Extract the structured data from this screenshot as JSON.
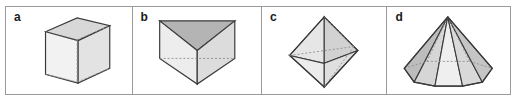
{
  "figure": {
    "caption_labels": [
      "a",
      "b",
      "c",
      "d"
    ],
    "panel_count": 4,
    "background_color": "#ffffff",
    "border_color": "#9a9a9a",
    "edge_color": "#3a3a3a",
    "hidden_edge_color": "#8d8d8d",
    "label_color": "#1a1a1a"
  },
  "panels": [
    {
      "label": "a",
      "shape_name": "cube",
      "shape_description": "cube drawn in parallel projection with hidden edges dashed",
      "faces": 6,
      "vertices": 8,
      "edges": 12,
      "fill_front": "#f2f2f2",
      "fill_top": "#d8d8d8",
      "fill_side": "#e3e3e3"
    },
    {
      "label": "b",
      "shape_name": "triangular-prism",
      "shape_description": "triangular prism standing on an edge, viewed from above with hidden edges dashed",
      "faces": 5,
      "vertices": 6,
      "edges": 9,
      "fill_front": "#ededed",
      "fill_top": "#b4b4b4",
      "fill_side": "#dcdcdc"
    },
    {
      "label": "c",
      "shape_name": "octahedron",
      "shape_description": "regular octahedron with upper and lower apex, hidden edges dashed",
      "faces": 8,
      "vertices": 6,
      "edges": 12,
      "fill_front": "#ececec",
      "fill_top": "#d2d2d2",
      "fill_side": "#dfdfdf"
    },
    {
      "label": "d",
      "shape_name": "hexagonal-pyramid",
      "shape_description": "hexagonal pyramid with single apex above a hexagonal base, hidden base edges dashed",
      "faces": 7,
      "vertices": 7,
      "edges": 12,
      "fill_front": "#ededed",
      "fill_top": "#c9c9c9",
      "fill_side": "#bdbdbd"
    }
  ]
}
